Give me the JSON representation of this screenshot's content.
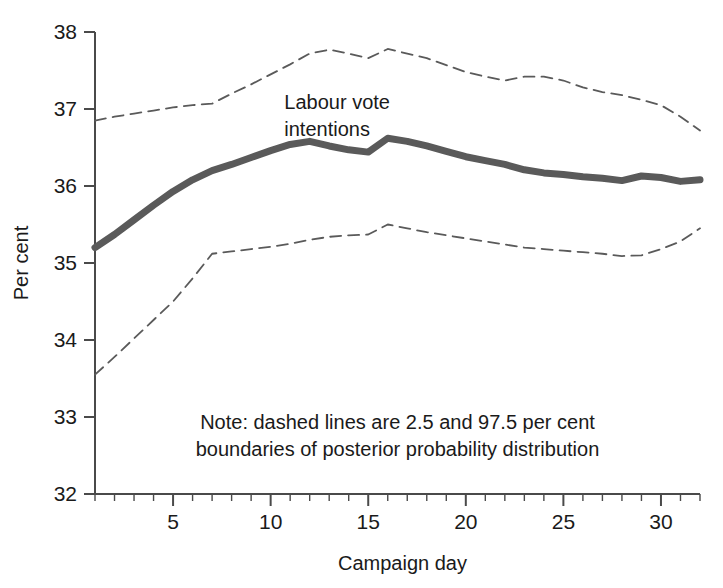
{
  "chart_data": {
    "type": "line",
    "title": "",
    "xlabel": "Campaign day",
    "ylabel": "Per cent",
    "xlim": [
      1,
      32
    ],
    "ylim": [
      32,
      38
    ],
    "grid": false,
    "legend_position": "inline-annotation",
    "x": [
      1,
      2,
      3,
      4,
      5,
      6,
      7,
      8,
      9,
      10,
      11,
      12,
      13,
      14,
      15,
      16,
      17,
      18,
      19,
      20,
      21,
      22,
      23,
      24,
      25,
      26,
      27,
      28,
      29,
      30,
      31,
      32
    ],
    "xticks": [
      5,
      10,
      15,
      20,
      25,
      30
    ],
    "xticklabels": [
      "5",
      "10",
      "15",
      "20",
      "25",
      "30"
    ],
    "xminorticks": [
      1,
      2,
      3,
      4,
      5,
      6,
      7,
      8,
      9,
      10,
      11,
      12,
      13,
      14,
      15,
      16,
      17,
      18,
      19,
      20,
      21,
      22,
      23,
      24,
      25,
      26,
      27,
      28,
      29,
      30,
      31,
      32
    ],
    "yticks": [
      32,
      33,
      34,
      35,
      36,
      37,
      38
    ],
    "yticklabels": [
      "32",
      "33",
      "34",
      "35",
      "36",
      "37",
      "38"
    ],
    "series": [
      {
        "name": "Labour vote intentions",
        "style": "solid-thick",
        "color": "#5a5a5a",
        "linewidth": 7,
        "values": [
          35.2,
          35.37,
          35.56,
          35.75,
          35.93,
          36.08,
          36.2,
          36.28,
          36.37,
          36.46,
          36.54,
          36.58,
          36.52,
          36.47,
          36.44,
          36.62,
          36.58,
          36.52,
          36.45,
          36.38,
          36.33,
          36.28,
          36.21,
          36.17,
          36.15,
          36.12,
          36.1,
          36.07,
          36.13,
          36.11,
          36.06,
          36.08
        ]
      },
      {
        "name": "97.5 per cent boundary",
        "style": "dashed",
        "color": "#5a5a5a",
        "linewidth": 1.8,
        "values": [
          36.85,
          36.9,
          36.94,
          36.98,
          37.02,
          37.05,
          37.07,
          37.2,
          37.32,
          37.45,
          37.58,
          37.72,
          37.77,
          37.72,
          37.66,
          37.78,
          37.72,
          37.66,
          37.57,
          37.48,
          37.42,
          37.37,
          37.42,
          37.42,
          37.37,
          37.28,
          37.22,
          37.18,
          37.12,
          37.05,
          36.9,
          36.72
        ]
      },
      {
        "name": "2.5 per cent boundary",
        "style": "dashed",
        "color": "#5a5a5a",
        "linewidth": 1.8,
        "values": [
          33.55,
          33.78,
          34.02,
          34.26,
          34.5,
          34.8,
          35.12,
          35.15,
          35.18,
          35.21,
          35.25,
          35.3,
          35.34,
          35.36,
          35.37,
          35.5,
          35.45,
          35.4,
          35.36,
          35.32,
          35.28,
          35.24,
          35.2,
          35.18,
          35.16,
          35.14,
          35.12,
          35.09,
          35.1,
          35.18,
          35.28,
          35.45
        ]
      }
    ],
    "annotations": [
      {
        "id": "series-label",
        "text_line1": "Labour vote",
        "text_line2": "intentions",
        "x": 10.7,
        "y": 37.0
      },
      {
        "id": "note",
        "text_line1": "Note: dashed lines are 2.5 and 97.5 per cent",
        "text_line2": "boundaries of posterior probability distribution",
        "x": 16.5,
        "y": 32.85
      }
    ]
  }
}
